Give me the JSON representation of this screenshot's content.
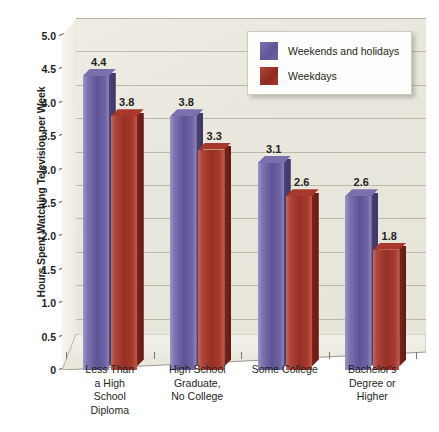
{
  "chart_data": {
    "type": "bar",
    "title": "",
    "xlabel": "",
    "ylabel": "Hours Spent Watching Television per Week",
    "ylim": [
      0,
      5.0
    ],
    "grid": true,
    "legend_position": "top-right",
    "categories": [
      "Less Than a High School Diploma",
      "High School Graduate, No College",
      "Some College",
      "Bachelor's Degree or Higher"
    ],
    "category_lines": [
      [
        "Less Than",
        "a High",
        "School",
        "Diploma"
      ],
      [
        "High School",
        "Graduate,",
        "No College"
      ],
      [
        "Some College"
      ],
      [
        "Bachelor's",
        "Degree or",
        "Higher"
      ]
    ],
    "series": [
      {
        "name": "Weekends and holidays",
        "color": "#5f5596",
        "values": [
          4.4,
          3.8,
          3.1,
          2.6
        ],
        "labels": [
          "4.4",
          "3.8",
          "3.1",
          "2.6"
        ]
      },
      {
        "name": "Weekdays",
        "color": "#a8382c",
        "values": [
          3.8,
          3.3,
          2.6,
          1.8
        ],
        "labels": [
          "3.8",
          "3.3",
          "2.6",
          "1.8"
        ]
      }
    ],
    "y_ticks": [
      5.0,
      4.5,
      4.0,
      3.5,
      3.0,
      2.5,
      2.0,
      1.5,
      1.0,
      0.5,
      0
    ],
    "y_tick_labels": [
      "5.0",
      "4.5",
      "4.0",
      "3.5",
      "3.0",
      "2.5",
      "2.0",
      "1.5",
      "1.0",
      "0.5",
      "0"
    ]
  },
  "legend": {
    "items": [
      {
        "label": "Weekends and holidays",
        "swatch": "purple-swatch"
      },
      {
        "label": "Weekdays",
        "swatch": "red-swatch"
      }
    ]
  }
}
